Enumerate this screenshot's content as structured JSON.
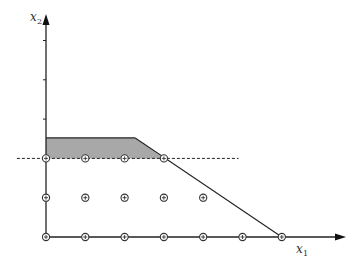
{
  "diagram": {
    "type": "integer-lattice-cutting-plane",
    "axes": {
      "x_label": "x",
      "x_subscript": "1",
      "y_label": "x",
      "y_subscript": "2",
      "origin_px": [
        46,
        237
      ],
      "unit_px": 39.3,
      "x_arrow_tip_px": 346,
      "y_arrow_tip_px": 14,
      "y_ticks": [
        1,
        2,
        3,
        4,
        5
      ]
    },
    "lattice_points": [
      [
        0,
        0
      ],
      [
        1,
        0
      ],
      [
        2,
        0
      ],
      [
        3,
        0
      ],
      [
        4,
        0
      ],
      [
        5,
        0
      ],
      [
        6,
        0
      ],
      [
        0,
        1
      ],
      [
        1,
        1
      ],
      [
        2,
        1
      ],
      [
        3,
        1
      ],
      [
        4,
        1
      ],
      [
        0,
        2
      ],
      [
        1,
        2
      ],
      [
        2,
        2
      ],
      [
        3,
        2
      ]
    ],
    "shaded_region": {
      "description": "cut-off region above cutting plane",
      "vertices": [
        [
          0,
          2
        ],
        [
          0,
          2.52
        ],
        [
          2.27,
          2.52
        ],
        [
          3,
          2
        ]
      ],
      "fill": "#a8a8a8"
    },
    "constraint_line": {
      "from": [
        2.27,
        2.52
      ],
      "to": [
        6,
        0
      ]
    },
    "cutting_plane": {
      "y": 2,
      "x_from": -0.74,
      "x_to": 4.9,
      "style": "dashed"
    },
    "colors": {
      "stroke": "#222222",
      "shade": "#a8a8a8",
      "point": "#333333"
    }
  }
}
